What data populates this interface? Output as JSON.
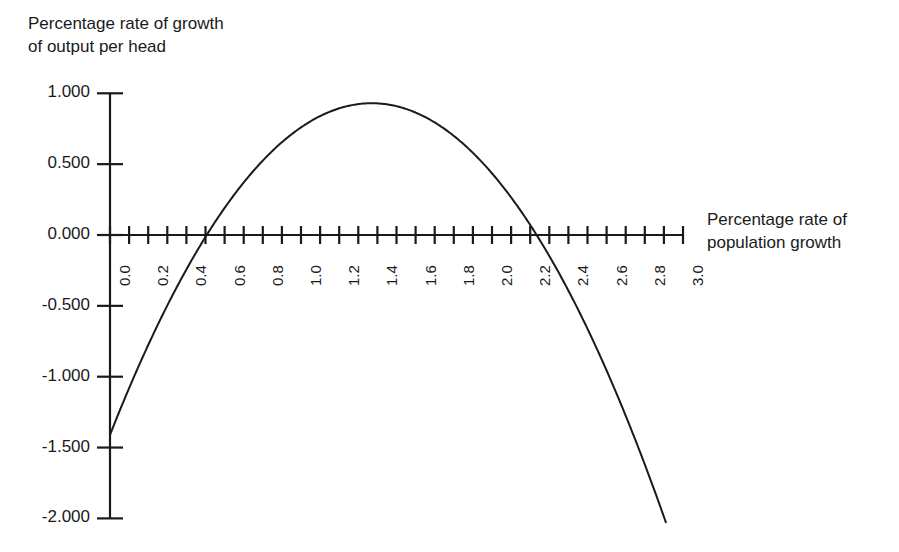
{
  "chart_data": {
    "type": "line",
    "title": "",
    "ylabel": "Percentage rate of growth\nof output per head",
    "xlabel": "Percentage rate of\npopulation growth",
    "xlim": [
      0.0,
      3.0
    ],
    "ylim": [
      -2.0,
      1.0
    ],
    "grid": false,
    "legend": null,
    "x_tick_labels": [
      "0.0",
      "0.2",
      "0.4",
      "0.6",
      "0.8",
      "1.0",
      "1.2",
      "1.4",
      "1.6",
      "1.8",
      "2.0",
      "2.2",
      "2.4",
      "2.6",
      "2.8",
      "3.0"
    ],
    "x_tick_values": [
      0.0,
      0.2,
      0.4,
      0.6,
      0.8,
      1.0,
      1.2,
      1.4,
      1.6,
      1.8,
      2.0,
      2.2,
      2.4,
      2.6,
      2.8,
      3.0
    ],
    "x_minor_tick_step": 0.1,
    "y_tick_labels": [
      "1.000",
      "0.500",
      "0.000",
      "-0.500",
      "-1.000",
      "-1.500",
      "-2.000"
    ],
    "y_tick_values": [
      1.0,
      0.5,
      0.0,
      -0.5,
      -1.0,
      -1.5,
      -2.0
    ],
    "series": [
      {
        "name": "output per head growth",
        "color": "#1a1a1a",
        "x": [
          0.0,
          0.1,
          0.2,
          0.3,
          0.4,
          0.5,
          0.6,
          0.7,
          0.8,
          0.9,
          1.0,
          1.1,
          1.2,
          1.3,
          1.37,
          1.4,
          1.5,
          1.6,
          1.7,
          1.8,
          1.9,
          2.0,
          2.1,
          2.2,
          2.24,
          2.3,
          2.4,
          2.5,
          2.6,
          2.7,
          2.8,
          2.9,
          2.91
        ],
        "y": [
          -1.41,
          -1.22,
          -1.05,
          -0.88,
          -0.73,
          -0.59,
          -0.46,
          -0.34,
          -0.23,
          -0.13,
          -0.04,
          0.04,
          0.11,
          0.17,
          0.19,
          0.19,
          0.2,
          0.19,
          0.18,
          0.15,
          0.11,
          0.06,
          0.0,
          -0.07,
          -0.1,
          -0.16,
          -0.26,
          -0.37,
          -0.49,
          -0.62,
          -0.76,
          -0.91,
          -0.93
        ]
      }
    ],
    "curve_description": {
      "shape": "inverted parabola",
      "value_at_x0": -1.41,
      "peak_x": 1.37,
      "peak_y": 0.93,
      "zero_crossing_left": 0.5,
      "zero_crossing_right": 2.24,
      "end_x": 2.91,
      "end_y": -2.0
    }
  },
  "axes": {
    "y_title": "Percentage rate of growth\nof output per head",
    "x_title": "Percentage rate of\npopulation growth"
  }
}
